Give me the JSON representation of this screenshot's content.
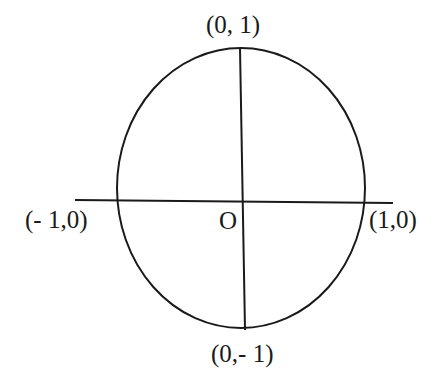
{
  "diagram": {
    "type": "unit-circle-axes",
    "stroke_color": "#1a1a1a",
    "background": "#ffffff",
    "labels": {
      "top": "(0, 1)",
      "left": "(- 1,0)",
      "right": "(1,0)",
      "bottom": "(0,- 1)",
      "origin": "O"
    },
    "points": [
      {
        "name": "top",
        "label": "(0, 1)"
      },
      {
        "name": "left",
        "label": "(- 1,0)"
      },
      {
        "name": "right",
        "label": "(1,0)"
      },
      {
        "name": "bottom",
        "label": "(0,- 1)"
      },
      {
        "name": "origin",
        "label": "O"
      }
    ]
  }
}
